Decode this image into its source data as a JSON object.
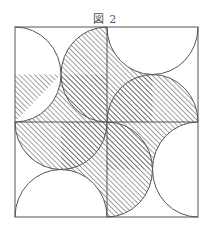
{
  "figure": {
    "title": "図 2",
    "colors": {
      "line": "#555555",
      "hatch": "#555555",
      "background": "#ffffff"
    }
  }
}
